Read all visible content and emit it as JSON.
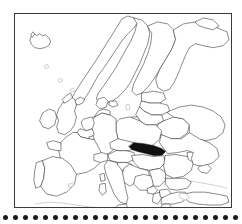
{
  "figure": {
    "kind": "map",
    "title": "",
    "caption": "",
    "highlighted_country": "Slovakia",
    "background_color": "#ffffff",
    "outline_color": "#2b2b2b",
    "highlight_color": "#111111",
    "frame_color": "#3a3a3a"
  },
  "frame": {
    "x": 14,
    "y": 13,
    "width": 218,
    "height": 195,
    "border_width": 1
  },
  "dot_rule": {
    "visible": true,
    "count": 24,
    "dot_diameter": 5,
    "spacing": 10,
    "start_x": 3,
    "y": 213,
    "color": "#1a1a1a"
  },
  "map_features": {
    "countries_outlined": [
      "Iceland",
      "Norway",
      "Sweden",
      "Finland",
      "Denmark",
      "Estonia",
      "Latvia",
      "Lithuania",
      "Belarus",
      "Russia",
      "Ukraine",
      "Moldova",
      "Poland",
      "Germany",
      "Netherlands",
      "Belgium",
      "Luxembourg",
      "France",
      "United Kingdom",
      "Ireland",
      "Spain",
      "Portugal",
      "Switzerland",
      "Austria",
      "Czech Republic",
      "Slovakia",
      "Hungary",
      "Slovenia",
      "Croatia",
      "Bosnia and Herzegovina",
      "Serbia",
      "Montenegro",
      "Albania",
      "North Macedonia",
      "Romania",
      "Bulgaria",
      "Greece",
      "Italy",
      "Turkey",
      "Cyprus"
    ],
    "shaded": [
      "Slovakia"
    ],
    "labels": [],
    "legend": []
  }
}
